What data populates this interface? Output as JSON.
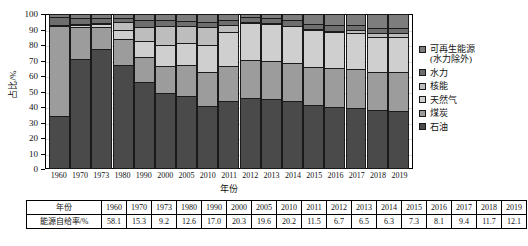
{
  "chart_data": {
    "type": "bar",
    "subtype": "stacked-percentage",
    "title": "",
    "xlabel": "年份",
    "ylabel": "占比/%",
    "ylim": [
      0,
      100
    ],
    "ytick_step": 10,
    "yticks": [
      100,
      90,
      80,
      70,
      60,
      50,
      40,
      30,
      20,
      10,
      0
    ],
    "grid": true,
    "legend_position": "right",
    "categories": [
      "1960",
      "1970",
      "1973",
      "1980",
      "1990",
      "2000",
      "2005",
      "2010",
      "2011",
      "2012",
      "2013",
      "2014",
      "2015",
      "2016",
      "2017",
      "2018",
      "2019"
    ],
    "series": [
      {
        "name": "石油",
        "color": "#4a4a4a",
        "values": [
          34.0,
          71.5,
          77.5,
          67.5,
          56.0,
          49.0,
          47.0,
          40.5,
          43.5,
          46.0,
          45.5,
          43.5,
          41.0,
          40.0,
          39.5,
          38.0,
          37.5
        ]
      },
      {
        "name": "煤炭",
        "color": "#9c9c9c",
        "values": [
          58.5,
          21.0,
          15.0,
          17.0,
          16.5,
          18.0,
          20.5,
          22.0,
          23.0,
          24.5,
          24.5,
          25.0,
          25.5,
          25.5,
          25.5,
          25.0,
          25.5
        ]
      },
      {
        "name": "天然气",
        "color": "#cfcfcf",
        "values": [
          1.0,
          1.0,
          1.5,
          6.0,
          10.5,
          13.5,
          14.5,
          18.0,
          22.5,
          24.0,
          24.5,
          24.5,
          24.0,
          23.5,
          23.5,
          22.5,
          22.5
        ]
      },
      {
        "name": "核能",
        "color": "#bdbdbd",
        "values": [
          0.0,
          0.3,
          0.6,
          4.7,
          9.5,
          12.5,
          11.0,
          11.5,
          4.5,
          0.7,
          0.4,
          0.0,
          0.3,
          0.8,
          1.4,
          2.8,
          2.8
        ]
      },
      {
        "name": "水力",
        "color": "#6e6e6e",
        "values": [
          5.5,
          4.2,
          3.5,
          3.0,
          4.0,
          3.5,
          3.0,
          3.3,
          3.5,
          3.4,
          3.3,
          3.5,
          3.5,
          3.5,
          3.5,
          3.5,
          3.5
        ]
      },
      {
        "name": "可再生能源(水力除外)",
        "color": "#7d7d7d",
        "values": [
          1.0,
          2.0,
          1.9,
          1.8,
          3.5,
          3.5,
          4.0,
          4.7,
          3.0,
          1.4,
          1.8,
          3.5,
          5.7,
          6.7,
          6.6,
          8.2,
          8.2
        ]
      }
    ]
  },
  "legend": {
    "items": [
      {
        "label": "可再生能源\n(水力除外)",
        "color": "#7d7d7d"
      },
      {
        "label": "水力",
        "color": "#6e6e6e"
      },
      {
        "label": "核能",
        "color": "#bdbdbd"
      },
      {
        "label": "天然气",
        "color": "#cfcfcf"
      },
      {
        "label": "煤炭",
        "color": "#9c9c9c"
      },
      {
        "label": "石油",
        "color": "#4a4a4a"
      }
    ]
  },
  "table": {
    "row_labels": [
      "年份",
      "能源自给率/%"
    ],
    "years": [
      "1960",
      "1970",
      "1973",
      "1980",
      "1990",
      "2000",
      "2005",
      "2010",
      "2011",
      "2012",
      "2013",
      "2014",
      "2015",
      "2016",
      "2017",
      "2018",
      "2019"
    ],
    "self_sufficiency": [
      "58.1",
      "15.3",
      "9.2",
      "12.6",
      "17.0",
      "20.3",
      "19.6",
      "20.2",
      "11.5",
      "6.7",
      "6.5",
      "6.3",
      "7.3",
      "8.1",
      "9.4",
      "11.7",
      "12.1"
    ]
  }
}
